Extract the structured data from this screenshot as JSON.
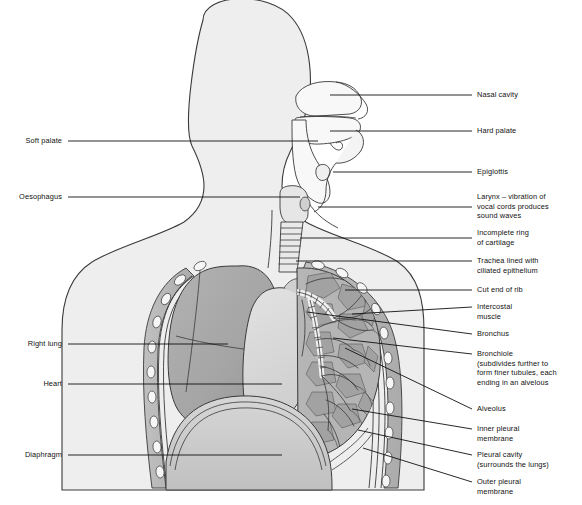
{
  "diagram": {
    "palette": {
      "body_fill": "#eeeeee",
      "cavity_fill": "#f7f7f7",
      "lung_fill": "#a8a8a8",
      "lung_dark": "#9a9a9a",
      "heart_fill": "#d8d8d8",
      "diaphragm_fill": "#c9c9c9",
      "chest_wall": "#b4b4b4",
      "rib_fill": "#f4f4f4",
      "bronchus_fill": "#bdbdbd",
      "outline": "#333333",
      "leader_line": "#111111",
      "label_text": "#111111"
    },
    "labels_right": [
      {
        "id": "nasal-cavity",
        "text": "Nasal cavity",
        "x": 477,
        "y": 90,
        "line": [
          330,
          95,
          472,
          95
        ]
      },
      {
        "id": "hard-palate",
        "text": "Hard palate",
        "x": 477,
        "y": 126,
        "line": [
          330,
          131,
          472,
          131
        ]
      },
      {
        "id": "epiglottis",
        "text": "Epiglottis",
        "x": 477,
        "y": 167,
        "line": [
          333,
          172,
          472,
          172
        ]
      },
      {
        "id": "larynx",
        "text": "Larynx – vibration of\nvocal cords produces\nsound waves",
        "x": 477,
        "y": 192,
        "line": [
          318,
          207,
          472,
          207
        ]
      },
      {
        "id": "incomplete-ring",
        "text": "Incomplete ring\nof cartilage",
        "x": 477,
        "y": 228,
        "line": [
          300,
          238,
          472,
          238
        ]
      },
      {
        "id": "trachea",
        "text": "Trachea lined with\nciliated epithelium",
        "x": 477,
        "y": 256,
        "line": [
          296,
          261,
          472,
          261
        ]
      },
      {
        "id": "cut-end-of-rib",
        "text": "Cut end of rib",
        "x": 477,
        "y": 285,
        "line": [
          345,
          290,
          472,
          290
        ]
      },
      {
        "id": "intercostal-muscle",
        "text": "Intercostal\nmuscle",
        "x": 477,
        "y": 302,
        "line": [
          352,
          314,
          472,
          307
        ]
      },
      {
        "id": "bronchus",
        "text": "Bronchus",
        "x": 477,
        "y": 329,
        "line": [
          307,
          312,
          472,
          334
        ]
      },
      {
        "id": "bronchiole",
        "text": "Bronchiole\n(subdivides further to\nform finer tubules, each\nending in an alvelous",
        "x": 477,
        "y": 349,
        "line": [
          333,
          338,
          472,
          354
        ]
      },
      {
        "id": "alveolus",
        "text": "Alveolus",
        "x": 477,
        "y": 404,
        "line": [
          345,
          348,
          472,
          409
        ]
      },
      {
        "id": "inner-pleural-membrane",
        "text": "Inner pleural\nmembrane",
        "x": 477,
        "y": 424,
        "line": [
          352,
          409,
          472,
          429
        ]
      },
      {
        "id": "pleural-cavity",
        "text": "Pleural cavity\n(surrounds the lungs)",
        "x": 477,
        "y": 450,
        "line": [
          358,
          430,
          472,
          455
        ]
      },
      {
        "id": "outer-pleural-membrane",
        "text": "Outer pleural\nmembrane",
        "x": 477,
        "y": 477,
        "line": [
          363,
          448,
          472,
          482
        ]
      }
    ],
    "labels_left": [
      {
        "id": "soft-palate",
        "text": "Soft palate",
        "x": 14,
        "y": 136,
        "line": [
          68,
          141,
          318,
          141
        ]
      },
      {
        "id": "oesophagus",
        "text": "Oesophagus",
        "x": 6,
        "y": 192,
        "line": [
          68,
          197,
          300,
          197
        ]
      },
      {
        "id": "right-lung",
        "text": "Right lung",
        "x": 14,
        "y": 339,
        "line": [
          68,
          344,
          228,
          344
        ]
      },
      {
        "id": "heart",
        "text": "Heart",
        "x": 32,
        "y": 379,
        "line": [
          68,
          384,
          282,
          384
        ]
      },
      {
        "id": "diaphragm",
        "text": "Diaphragm",
        "x": 14,
        "y": 450,
        "line": [
          68,
          455,
          282,
          455
        ]
      }
    ]
  }
}
